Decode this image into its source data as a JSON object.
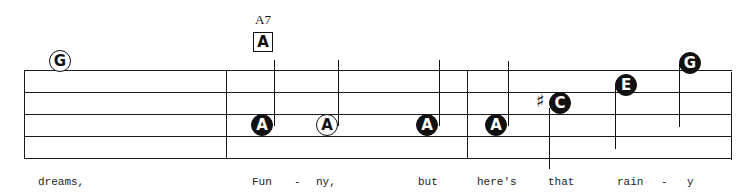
{
  "score": {
    "chord": {
      "name": "A7",
      "box_label": "A"
    },
    "notes": [
      {
        "label": "G",
        "style": "open"
      },
      {
        "label": "A",
        "style": "filled"
      },
      {
        "label": "A",
        "style": "open"
      },
      {
        "label": "A",
        "style": "filled"
      },
      {
        "label": "A",
        "style": "filled"
      },
      {
        "label": "C",
        "style": "filled",
        "accidental": "♯"
      },
      {
        "label": "E",
        "style": "filled"
      },
      {
        "label": "G",
        "style": "filled"
      }
    ],
    "lyrics": [
      "dreams,",
      "Fun",
      "-",
      "ny,",
      "but",
      "here's",
      "that",
      "rain",
      "-",
      "y"
    ]
  }
}
